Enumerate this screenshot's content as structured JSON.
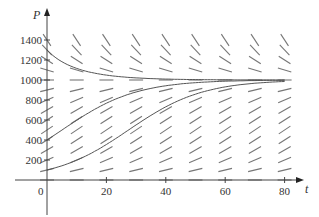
{
  "chart_data": {
    "type": "line",
    "title": "",
    "subtitle": "Direction field for logistic equation dP/dt = kP(1 - P/1000)",
    "xlabel": "t",
    "ylabel": "P",
    "xlim": [
      -15,
      90
    ],
    "ylim": [
      -200,
      1500
    ],
    "x_ticks": [
      0,
      20,
      40,
      60,
      80
    ],
    "x_tick_labels": [
      "0",
      "20",
      "40",
      "60",
      "80"
    ],
    "y_ticks": [
      200,
      400,
      600,
      800,
      1000,
      1200,
      1400
    ],
    "y_tick_labels": [
      "200",
      "400",
      "600",
      "800",
      "1000",
      "1200",
      "1400"
    ],
    "grid": false,
    "legend": null,
    "carrying_capacity": 1000,
    "growth_rate_k": 0.08,
    "slope_field": {
      "t_values": [
        0,
        10,
        20,
        30,
        40,
        50,
        60,
        70,
        80
      ],
      "p_values": [
        0,
        100,
        200,
        300,
        400,
        500,
        600,
        700,
        800,
        900,
        1000,
        1100,
        1200,
        1300,
        1400
      ]
    },
    "series": [
      {
        "name": "P(0)=1300",
        "initial": 1300,
        "t": [
          0,
          10,
          20,
          30,
          40,
          60,
          80
        ],
        "values": [
          1300,
          1134,
          1056,
          1024,
          1010,
          1002,
          1000
        ]
      },
      {
        "name": "P(0)=400",
        "initial": 400,
        "t": [
          0,
          10,
          20,
          30,
          40,
          60,
          80
        ],
        "values": [
          400,
          597,
          766,
          879,
          942,
          987,
          997
        ]
      },
      {
        "name": "P(0)=100",
        "initial": 100,
        "t": [
          0,
          10,
          20,
          30,
          40,
          60,
          80
        ],
        "values": [
          100,
          198,
          350,
          540,
          719,
          923,
          983
        ]
      }
    ]
  },
  "axes": {
    "x_label": "t",
    "y_label": "P",
    "origin_label": "0"
  }
}
